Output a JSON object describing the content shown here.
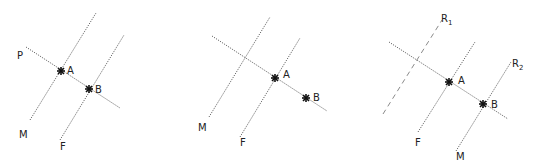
{
  "panels": [
    {
      "id": "panel-1",
      "labels": {
        "p": "P",
        "a": "A",
        "b": "B",
        "m": "M",
        "f": "F"
      }
    },
    {
      "id": "panel-2",
      "labels": {
        "a": "A",
        "b": "B",
        "m": "M",
        "f": "F"
      }
    },
    {
      "id": "panel-3",
      "labels": {
        "r1": "R",
        "r1_sub": "1",
        "r2": "R",
        "r2_sub": "2",
        "a": "A",
        "b": "B",
        "f": "F",
        "m": "M"
      }
    }
  ],
  "colors": {
    "line": "#6a6a6a",
    "point": "#111111",
    "text": "#222222"
  }
}
